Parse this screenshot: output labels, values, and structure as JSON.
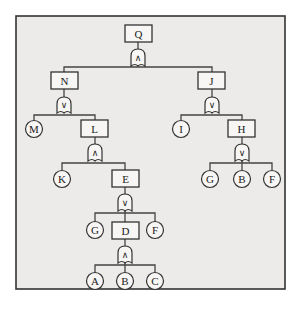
{
  "diagram": {
    "type": "fault-tree",
    "nodes": {
      "Q": "Q",
      "N": "N",
      "J": "J",
      "M": "M",
      "L": "L",
      "I": "I",
      "H": "H",
      "K": "K",
      "E": "E",
      "G1": "G",
      "B1": "B",
      "F1": "F",
      "G2": "G",
      "D": "D",
      "F2": "F",
      "A": "A",
      "B2": "B",
      "C": "C"
    },
    "gates": {
      "Q_gate": "∧",
      "N_gate": "∨",
      "J_gate": "∨",
      "L_gate": "∧",
      "H_gate": "∨",
      "E_gate": "∨",
      "D_gate": "∧"
    },
    "structure": [
      {
        "event": "Q",
        "gate": "AND",
        "children": [
          "N",
          "J"
        ]
      },
      {
        "event": "N",
        "gate": "OR",
        "children": [
          "M",
          "L"
        ]
      },
      {
        "event": "J",
        "gate": "OR",
        "children": [
          "I",
          "H"
        ]
      },
      {
        "event": "L",
        "gate": "AND",
        "children": [
          "K",
          "E"
        ]
      },
      {
        "event": "H",
        "gate": "OR",
        "children": [
          "G",
          "B",
          "F"
        ]
      },
      {
        "event": "E",
        "gate": "OR",
        "children": [
          "G",
          "D",
          "F"
        ]
      },
      {
        "event": "D",
        "gate": "AND",
        "children": [
          "A",
          "B",
          "C"
        ]
      }
    ]
  }
}
